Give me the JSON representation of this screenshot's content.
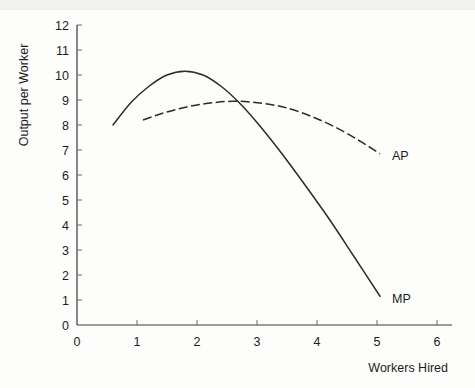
{
  "chart_data": {
    "type": "line",
    "title": "",
    "xlabel": "Workers Hired",
    "ylabel": "Output per Worker",
    "xlim": [
      0,
      6.6
    ],
    "ylim": [
      0,
      12
    ],
    "xticks": [
      "0",
      "1",
      "2",
      "3",
      "4",
      "5",
      "6"
    ],
    "yticks": [
      "0",
      "1",
      "2",
      "3",
      "4",
      "5",
      "6",
      "7",
      "8",
      "9",
      "10",
      "11",
      "12"
    ],
    "grid": false,
    "legend_position": "inline-end-of-curve",
    "series": [
      {
        "name": "MP",
        "label": "MP",
        "style": "solid",
        "color": "#2b2b2b",
        "x": [
          0.6,
          0.9,
          1.2,
          1.5,
          1.8,
          2.1,
          2.4,
          2.7,
          3.0,
          3.4,
          3.8,
          4.2,
          4.6,
          5.05
        ],
        "y": [
          8.0,
          8.9,
          9.55,
          10.0,
          10.15,
          10.0,
          9.55,
          8.9,
          8.1,
          6.9,
          5.6,
          4.25,
          2.8,
          1.15
        ]
      },
      {
        "name": "AP",
        "label": "AP",
        "style": "dashed",
        "color": "#2b2b2b",
        "x": [
          1.1,
          1.4,
          1.7,
          2.0,
          2.3,
          2.6,
          2.9,
          3.2,
          3.5,
          3.9,
          4.3,
          4.7,
          5.05
        ],
        "y": [
          8.2,
          8.45,
          8.65,
          8.8,
          8.9,
          8.95,
          8.92,
          8.83,
          8.68,
          8.35,
          7.92,
          7.38,
          6.85
        ]
      }
    ],
    "annotations": [
      {
        "text": "AP",
        "x": 5.25,
        "y": 6.75
      },
      {
        "text": "MP",
        "x": 5.25,
        "y": 1.05
      }
    ]
  },
  "axis": {
    "y_title": "Output per Worker",
    "x_title": "Workers Hired"
  }
}
